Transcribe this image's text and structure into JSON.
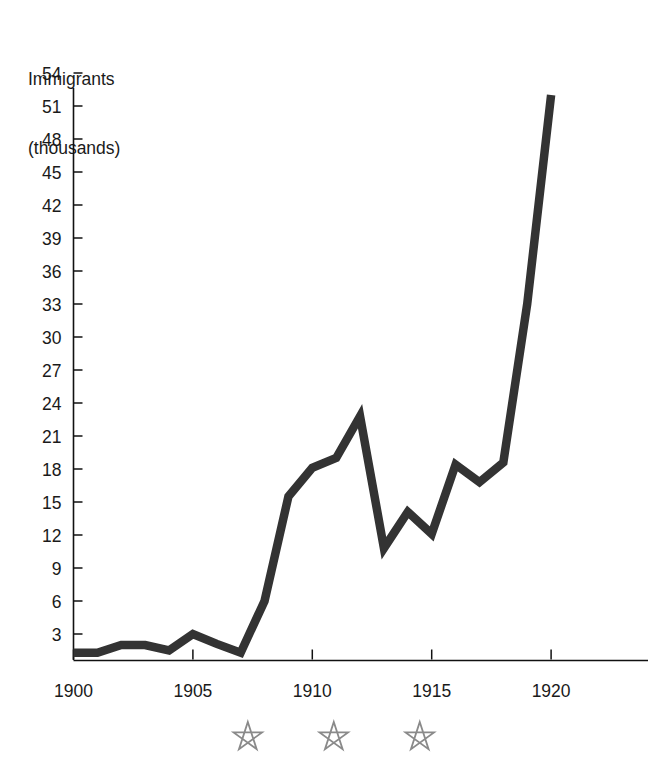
{
  "chart_data": {
    "type": "line",
    "title": "",
    "ylabel_line1": "Immigrants",
    "ylabel_line2": "(thousands)",
    "xlabel": "",
    "grid": false,
    "legend": null,
    "line_color": "#333333",
    "star_color": "#8a8a8a",
    "ylim": [
      0,
      55.5
    ],
    "xlim": [
      1899.4,
      1923.6
    ],
    "ytick_values": [
      3,
      6,
      9,
      12,
      15,
      18,
      21,
      24,
      27,
      30,
      33,
      36,
      39,
      42,
      45,
      48,
      51,
      54
    ],
    "ytick_labels": [
      "3",
      "6",
      "9",
      "12",
      "15",
      "18",
      "21",
      "24",
      "27",
      "30",
      "33",
      "36",
      "39",
      "42",
      "45",
      "48",
      "51",
      "54"
    ],
    "xtick_values": [
      1900,
      1905,
      1910,
      1915,
      1920
    ],
    "xtick_labels": [
      "1900",
      "1905",
      "1910",
      "1915",
      "1920"
    ],
    "xtick_minor_values": [
      1900,
      1905,
      1910,
      1915,
      1920
    ],
    "x": [
      1900,
      1901,
      1902,
      1903,
      1904,
      1905,
      1906,
      1907,
      1908,
      1909,
      1910,
      1911,
      1912,
      1913,
      1914,
      1915,
      1916,
      1917,
      1918,
      1919,
      1920
    ],
    "values": [
      1.3,
      1.3,
      2.0,
      2.0,
      1.5,
      3.0,
      2.1,
      1.3,
      6.0,
      15.5,
      18.1,
      19.0,
      22.8,
      10.8,
      14.1,
      12.1,
      18.4,
      16.8,
      18.6,
      33.0,
      52.0
    ],
    "annotations": [
      {
        "name": "star",
        "x": 1907.3,
        "label": "☆"
      },
      {
        "name": "star",
        "x": 1910.9,
        "label": "☆"
      },
      {
        "name": "star",
        "x": 1914.5,
        "label": "☆"
      }
    ]
  }
}
